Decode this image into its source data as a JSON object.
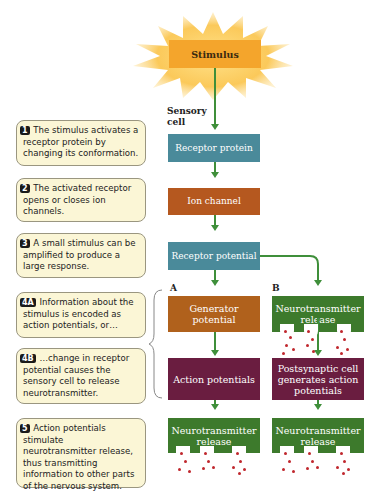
{
  "stimulus": {
    "label": "Stimulus"
  },
  "sensory_cell_label": "Sensory cell",
  "notes": [
    {
      "num": "1",
      "text": "The stimulus activates a receptor protein by changing its conformation."
    },
    {
      "num": "2",
      "text": "The activated receptor opens or closes ion channels."
    },
    {
      "num": "3",
      "text": "A small stimulus can be amplified to produce a large response."
    },
    {
      "num": "4A",
      "text": "Information about the stimulus is encoded as action potentials, or…"
    },
    {
      "num": "4B",
      "text": "…change in receptor potential causes the sensory cell to release neurotransmitter."
    },
    {
      "num": "5",
      "text": "Action potentials stimulate neurotransmitter release, thus transmitting information to other parts of the nervous system."
    }
  ],
  "flow": {
    "receptor_protein": "Receptor protein",
    "ion_channel": "Ion channel",
    "receptor_potential": "Receptor potential",
    "path_a": {
      "label": "A",
      "generator_potential": "Generator potential",
      "action_potentials": "Action potentials",
      "nt_release": "Neurotransmitter release"
    },
    "path_b": {
      "label": "B",
      "nt_release_1": "Neurotransmitter release",
      "postsynaptic": "Postsynaptic cell generates action potentials",
      "nt_release_2": "Neurotransmitter release"
    }
  },
  "colors": {
    "teal": "#4a8a9a",
    "orange": "#b5581f",
    "purple": "#6a1d40",
    "green": "#3d7a2c",
    "arrow": "#3f8f3a",
    "note_bg": "#fbf6d6",
    "stimulus": "#f2a830"
  }
}
